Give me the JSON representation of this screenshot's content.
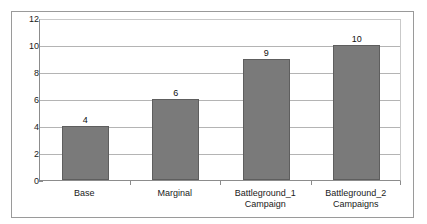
{
  "chart_data": {
    "type": "bar",
    "title": "",
    "subtitle": "",
    "xlabel": "",
    "ylabel": "",
    "categories": [
      "Base",
      "Marginal",
      "Battleground_1 Campaign",
      "Battleground_2 Campaigns"
    ],
    "category_lines": [
      [
        "Base"
      ],
      [
        "Marginal"
      ],
      [
        "Battleground_1",
        "Campaign"
      ],
      [
        "Battleground_2",
        "Campaigns"
      ]
    ],
    "values": [
      4,
      6,
      9,
      10
    ],
    "value_labels": [
      "4",
      "6",
      "9",
      "10"
    ],
    "ylim": [
      0,
      12
    ],
    "ytick_values": [
      0,
      2,
      4,
      6,
      8,
      10,
      12
    ],
    "ytick_labels": [
      "0",
      "2",
      "4",
      "6",
      "8",
      "10",
      "12"
    ],
    "grid": true,
    "legend": false,
    "legend_position": "none",
    "bar_color": "#7a7a7a",
    "bar_border_color": "#5e5e5e",
    "gridline_color": "#b4b4b4",
    "axis_color": "#8c8c8c",
    "frame_color": "#9a9a9a",
    "text_color": "#1a1a1a",
    "plot_background": "#ffffff"
  }
}
